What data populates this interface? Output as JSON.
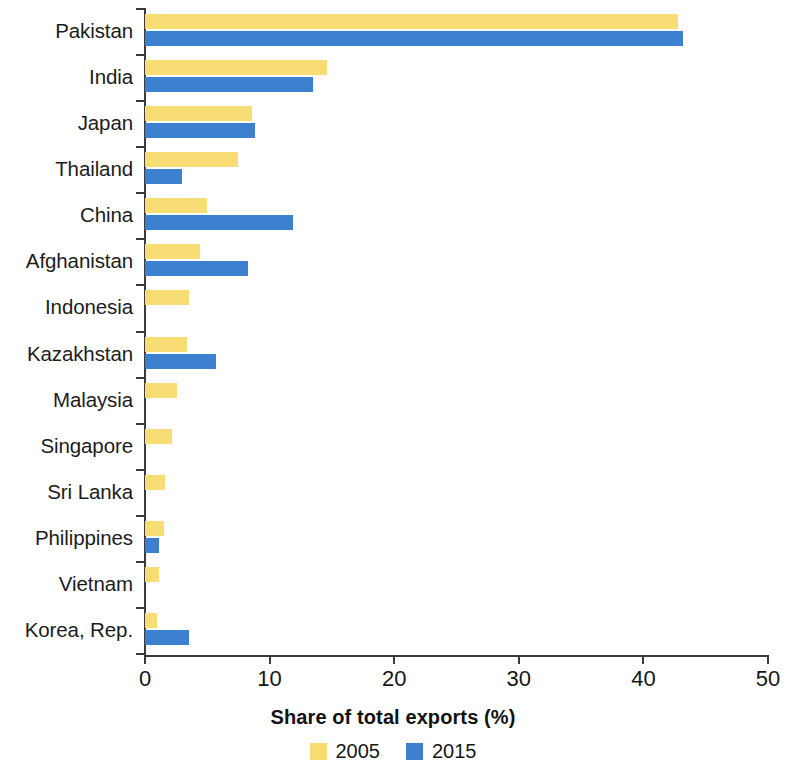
{
  "chart_data": {
    "type": "bar",
    "orientation": "horizontal",
    "title": "",
    "xlabel": "Share of total exports (%)",
    "ylabel": "",
    "xlim": [
      0,
      50
    ],
    "xticks": [
      0,
      10,
      20,
      30,
      40,
      50
    ],
    "grid": false,
    "legend_position": "bottom",
    "categories": [
      "Pakistan",
      "India",
      "Japan",
      "Thailand",
      "China",
      "Afghanistan",
      "Indonesia",
      "Kazakhstan",
      "Malaysia",
      "Singapore",
      "Sri Lanka",
      "Philippines",
      "Vietnam",
      "Korea, Rep."
    ],
    "series": [
      {
        "name": "2005",
        "color": "#f7dd73",
        "values": [
          42.8,
          14.6,
          8.6,
          7.5,
          5.0,
          4.4,
          3.5,
          3.4,
          2.6,
          2.2,
          1.6,
          1.5,
          1.1,
          1.0
        ]
      },
      {
        "name": "2015",
        "color": "#3c80cf",
        "values": [
          43.2,
          13.5,
          8.8,
          3.0,
          11.9,
          8.3,
          0,
          5.7,
          0,
          0,
          0,
          1.1,
          0,
          3.5
        ]
      }
    ]
  },
  "legend": {
    "items": [
      {
        "label": "2005",
        "color": "#f7dd73"
      },
      {
        "label": "2015",
        "color": "#3c80cf"
      }
    ]
  },
  "axis": {
    "x_title": "Share of total exports (%)",
    "x_tick_labels": [
      "0",
      "10",
      "20",
      "30",
      "40",
      "50"
    ]
  }
}
